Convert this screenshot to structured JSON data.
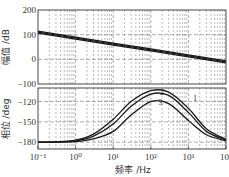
{
  "chart_data": [
    {
      "type": "line",
      "panel": "magnitude",
      "title": "",
      "xlabel": "",
      "ylabel": "幅值 /dB",
      "xscale": "log",
      "xlim": [
        0.1,
        10000
      ],
      "ylim": [
        -100,
        200
      ],
      "yticks": [
        -100,
        0,
        100,
        200
      ],
      "ytick_labels": [
        "−100",
        "0",
        "100",
        "200"
      ],
      "grid": true,
      "grid_style": "dashed",
      "x": [
        0.1,
        1,
        10,
        100,
        1000,
        10000
      ],
      "series": [
        {
          "name": "1",
          "values": [
            114,
            90,
            66,
            42,
            18,
            -6
          ]
        },
        {
          "name": "2",
          "values": [
            110,
            86,
            62,
            38,
            14,
            -10
          ]
        },
        {
          "name": "3",
          "values": [
            106,
            82,
            58,
            34,
            10,
            -14
          ]
        }
      ]
    },
    {
      "type": "line",
      "panel": "phase",
      "title": "",
      "xlabel": "频率 /Hz",
      "ylabel": "相位 /deg",
      "xscale": "log",
      "xlim": [
        0.1,
        10000
      ],
      "ylim": [
        -190,
        -100
      ],
      "xticks": [
        0.1,
        1,
        10,
        100,
        1000,
        10000
      ],
      "xtick_labels": [
        "10⁻¹",
        "10⁰",
        "10¹",
        "10²",
        "10³",
        "10⁴"
      ],
      "yticks": [
        -180,
        -150,
        -120
      ],
      "ytick_labels": [
        "−180",
        "−150",
        "−120"
      ],
      "grid": true,
      "grid_style": "dashed",
      "x": [
        0.1,
        0.3,
        1,
        3,
        10,
        30,
        100,
        300,
        1000,
        3000,
        10000
      ],
      "series": [
        {
          "name": "1",
          "values": [
            -180,
            -179.5,
            -177,
            -168,
            -146,
            -120,
            -104,
            -106,
            -130,
            -160,
            -176
          ]
        },
        {
          "name": "2",
          "values": [
            -180,
            -179.6,
            -178,
            -171,
            -153,
            -127,
            -109,
            -111,
            -136,
            -164,
            -177
          ]
        },
        {
          "name": "3",
          "values": [
            -180,
            -179.8,
            -179,
            -175,
            -164,
            -140,
            -120,
            -123,
            -148,
            -169,
            -178
          ]
        }
      ],
      "annotations": [
        {
          "text": "1",
          "x": 1500,
          "y": -119
        },
        {
          "text": "2",
          "x": 200,
          "y": -110
        },
        {
          "text": "3",
          "x": 180,
          "y": -125
        }
      ]
    }
  ],
  "labels": {
    "mag_ylabel": "幅值 /dB",
    "phase_ylabel": "相位 /deg",
    "xlabel": "频率 /Hz"
  },
  "colors": {
    "line": "#1a1a1a",
    "grid": "#777777",
    "frame": "#333333"
  }
}
